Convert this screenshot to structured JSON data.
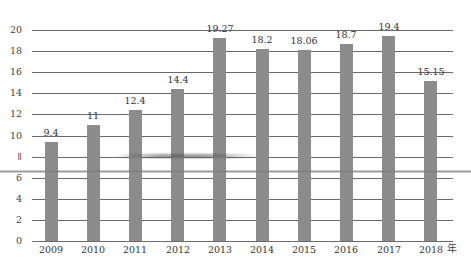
{
  "chart_data": {
    "type": "bar",
    "title": "",
    "xlabel": "年",
    "ylabel": "",
    "categories": [
      "2009",
      "2010",
      "2011",
      "2012",
      "2013",
      "2014",
      "2015",
      "2016",
      "2017",
      "2018"
    ],
    "values": [
      9.4,
      11,
      12.4,
      14.4,
      19.27,
      18.2,
      18.06,
      18.7,
      19.4,
      15.15
    ],
    "value_labels": [
      "9.4",
      "11",
      "12.4",
      "14.4",
      "19.27",
      "18.2",
      "18.06",
      "18.7",
      "19.4",
      "15.15"
    ],
    "yticks": [
      0,
      2,
      4,
      6,
      8,
      10,
      12,
      14,
      16,
      18,
      20
    ],
    "ytick_labels": [
      "0",
      "2",
      "4",
      "6",
      "ǁ",
      "10",
      "12",
      "14",
      "16",
      "18",
      "20"
    ],
    "ylim": [
      0,
      20
    ],
    "grid": true,
    "legend": null,
    "colors": {
      "bar": "#8c8c8c",
      "grid": "#6a6a6a"
    }
  },
  "x_unit_label": "年"
}
